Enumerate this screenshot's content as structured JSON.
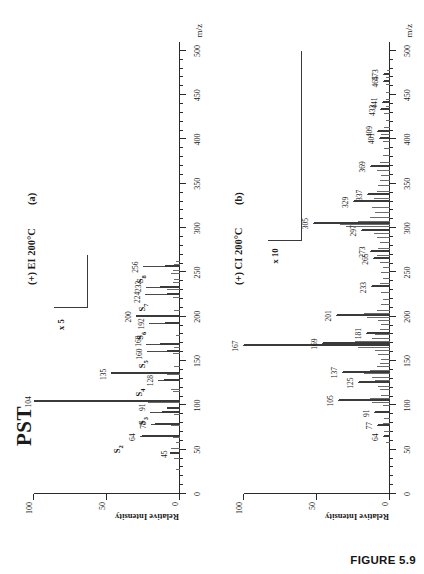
{
  "figure": {
    "caption": "FIGURE 5.9",
    "sample_title": "PST"
  },
  "axis": {
    "x_title": "m/z",
    "y_title": "Relative Intensity",
    "x_ticks": [
      0,
      50,
      100,
      150,
      200,
      250,
      300,
      350,
      400,
      450,
      500
    ],
    "y_ticks": [
      0,
      50,
      100
    ]
  },
  "panels": [
    {
      "tag": "(a)",
      "conditions": "(+) EI  200°C",
      "magnification": "x 5",
      "mag_region_start": 210,
      "mag_region_end": 270
    },
    {
      "tag": "(b)",
      "conditions": "(+) CI  200°C",
      "magnification": "x 10",
      "mag_region_start": 285,
      "mag_region_end": 500
    }
  ],
  "chart_data": [
    {
      "type": "bar",
      "title": "PST (+) EI 200°C mass spectrum",
      "xlabel": "m/z",
      "ylabel": "Relative Intensity",
      "xlim": [
        0,
        510
      ],
      "ylim": [
        0,
        100
      ],
      "grid": false,
      "annotations": [
        "PST",
        "(+) EI  200°C",
        "(a)",
        "x 5"
      ],
      "labeled_peaks": [
        {
          "mz": 45,
          "intensity": 7,
          "label": "45"
        },
        {
          "mz": 64,
          "intensity": 26,
          "label": "64",
          "series_tag": "S2"
        },
        {
          "mz": 78,
          "intensity": 17,
          "label": "78"
        },
        {
          "mz": 91,
          "intensity": 12,
          "label": "91"
        },
        {
          "mz": 96,
          "intensity": 9,
          "label": "",
          "series_tag": "S3"
        },
        {
          "mz": 104,
          "intensity": 100,
          "label": "104"
        },
        {
          "mz": 128,
          "intensity": 11,
          "label": "128",
          "series_tag": "S4"
        },
        {
          "mz": 135,
          "intensity": 47,
          "label": "135"
        },
        {
          "mz": 160,
          "intensity": 9,
          "label": "160",
          "series_tag": "S5"
        },
        {
          "mz": 168,
          "intensity": 14,
          "label": "168"
        },
        {
          "mz": 192,
          "intensity": 10,
          "label": "192",
          "series_tag": "S6"
        },
        {
          "mz": 200,
          "intensity": 30,
          "label": "200"
        },
        {
          "mz": 224,
          "intensity": 9,
          "label": "224",
          "series_tag": "S7"
        },
        {
          "mz": 232,
          "intensity": 14,
          "label": "232"
        },
        {
          "mz": 256,
          "intensity": 10,
          "label": "256",
          "series_tag": "S8"
        }
      ],
      "series_tags": [
        "S2",
        "S3",
        "S4",
        "S5",
        "S6",
        "S7",
        "S8"
      ]
    },
    {
      "type": "bar",
      "title": "PST (+) CI 200°C mass spectrum",
      "xlabel": "m/z",
      "ylabel": "Relative Intensity",
      "xlim": [
        0,
        510
      ],
      "ylim": [
        0,
        100
      ],
      "grid": false,
      "annotations": [
        "(+) CI  200°C",
        "(b)",
        "x 10"
      ],
      "labeled_peaks": [
        {
          "mz": 64,
          "intensity": 4,
          "label": "64"
        },
        {
          "mz": 77,
          "intensity": 8,
          "label": "77"
        },
        {
          "mz": 91,
          "intensity": 10,
          "label": "91"
        },
        {
          "mz": 105,
          "intensity": 35,
          "label": "105"
        },
        {
          "mz": 125,
          "intensity": 21,
          "label": "125"
        },
        {
          "mz": 137,
          "intensity": 32,
          "label": "137"
        },
        {
          "mz": 167,
          "intensity": 100,
          "label": "167"
        },
        {
          "mz": 169,
          "intensity": 46,
          "label": "169"
        },
        {
          "mz": 181,
          "intensity": 16,
          "label": "181"
        },
        {
          "mz": 201,
          "intensity": 36,
          "label": "201"
        },
        {
          "mz": 233,
          "intensity": 12,
          "label": "233"
        },
        {
          "mz": 265,
          "intensity": 11,
          "label": "265"
        },
        {
          "mz": 273,
          "intensity": 13,
          "label": "273"
        },
        {
          "mz": 297,
          "intensity": 19,
          "label": "297"
        },
        {
          "mz": 305,
          "intensity": 52,
          "label": "305"
        },
        {
          "mz": 329,
          "intensity": 25,
          "label": "329"
        },
        {
          "mz": 337,
          "intensity": 15,
          "label": "337"
        },
        {
          "mz": 369,
          "intensity": 13,
          "label": "369"
        },
        {
          "mz": 401,
          "intensity": 7,
          "label": "401"
        },
        {
          "mz": 409,
          "intensity": 8,
          "label": "409"
        },
        {
          "mz": 433,
          "intensity": 6,
          "label": "433"
        },
        {
          "mz": 441,
          "intensity": 5,
          "label": "441"
        },
        {
          "mz": 465,
          "intensity": 4,
          "label": "465"
        },
        {
          "mz": 473,
          "intensity": 4,
          "label": "473"
        }
      ]
    }
  ],
  "noise_a": [
    {
      "mz": 27,
      "intensity": 3
    },
    {
      "mz": 39,
      "intensity": 4
    },
    {
      "mz": 51,
      "intensity": 6
    },
    {
      "mz": 58,
      "intensity": 3
    },
    {
      "mz": 63,
      "intensity": 5
    },
    {
      "mz": 65,
      "intensity": 7
    },
    {
      "mz": 77,
      "intensity": 6
    },
    {
      "mz": 79,
      "intensity": 5
    },
    {
      "mz": 89,
      "intensity": 4
    },
    {
      "mz": 92,
      "intensity": 5
    },
    {
      "mz": 103,
      "intensity": 22
    },
    {
      "mz": 105,
      "intensity": 18
    },
    {
      "mz": 115,
      "intensity": 5
    },
    {
      "mz": 117,
      "intensity": 6
    },
    {
      "mz": 129,
      "intensity": 6
    },
    {
      "mz": 134,
      "intensity": 9
    },
    {
      "mz": 143,
      "intensity": 4
    },
    {
      "mz": 158,
      "intensity": 5
    },
    {
      "mz": 165,
      "intensity": 4
    },
    {
      "mz": 178,
      "intensity": 3
    },
    {
      "mz": 193,
      "intensity": 5
    },
    {
      "mz": 207,
      "intensity": 4
    },
    {
      "mz": 221,
      "intensity": 5
    },
    {
      "mz": 226,
      "intensity": 6
    },
    {
      "mz": 230,
      "intensity": 9
    },
    {
      "mz": 234,
      "intensity": 7
    },
    {
      "mz": 238,
      "intensity": 5
    },
    {
      "mz": 242,
      "intensity": 4
    },
    {
      "mz": 248,
      "intensity": 6
    },
    {
      "mz": 252,
      "intensity": 5
    },
    {
      "mz": 258,
      "intensity": 4
    },
    {
      "mz": 262,
      "intensity": 3
    }
  ],
  "noise_b": [
    {
      "mz": 57,
      "intensity": 3
    },
    {
      "mz": 70,
      "intensity": 4
    },
    {
      "mz": 79,
      "intensity": 5
    },
    {
      "mz": 85,
      "intensity": 4
    },
    {
      "mz": 93,
      "intensity": 6
    },
    {
      "mz": 99,
      "intensity": 5
    },
    {
      "mz": 103,
      "intensity": 12
    },
    {
      "mz": 107,
      "intensity": 14
    },
    {
      "mz": 111,
      "intensity": 6
    },
    {
      "mz": 117,
      "intensity": 7
    },
    {
      "mz": 121,
      "intensity": 8
    },
    {
      "mz": 127,
      "intensity": 10
    },
    {
      "mz": 131,
      "intensity": 12
    },
    {
      "mz": 135,
      "intensity": 18
    },
    {
      "mz": 139,
      "intensity": 14
    },
    {
      "mz": 143,
      "intensity": 9
    },
    {
      "mz": 147,
      "intensity": 7
    },
    {
      "mz": 151,
      "intensity": 6
    },
    {
      "mz": 157,
      "intensity": 8
    },
    {
      "mz": 161,
      "intensity": 10
    },
    {
      "mz": 165,
      "intensity": 22
    },
    {
      "mz": 171,
      "intensity": 24
    },
    {
      "mz": 175,
      "intensity": 12
    },
    {
      "mz": 179,
      "intensity": 10
    },
    {
      "mz": 185,
      "intensity": 7
    },
    {
      "mz": 191,
      "intensity": 6
    },
    {
      "mz": 195,
      "intensity": 8
    },
    {
      "mz": 199,
      "intensity": 16
    },
    {
      "mz": 203,
      "intensity": 18
    },
    {
      "mz": 207,
      "intensity": 9
    },
    {
      "mz": 213,
      "intensity": 6
    },
    {
      "mz": 219,
      "intensity": 5
    },
    {
      "mz": 227,
      "intensity": 6
    },
    {
      "mz": 237,
      "intensity": 7
    },
    {
      "mz": 243,
      "intensity": 5
    },
    {
      "mz": 249,
      "intensity": 6
    },
    {
      "mz": 255,
      "intensity": 5
    },
    {
      "mz": 261,
      "intensity": 7
    },
    {
      "mz": 269,
      "intensity": 9
    },
    {
      "mz": 277,
      "intensity": 8
    },
    {
      "mz": 283,
      "intensity": 7
    },
    {
      "mz": 289,
      "intensity": 9
    },
    {
      "mz": 293,
      "intensity": 11
    },
    {
      "mz": 301,
      "intensity": 30
    },
    {
      "mz": 303,
      "intensity": 34
    },
    {
      "mz": 307,
      "intensity": 22
    },
    {
      "mz": 311,
      "intensity": 14
    },
    {
      "mz": 317,
      "intensity": 10
    },
    {
      "mz": 323,
      "intensity": 12
    },
    {
      "mz": 333,
      "intensity": 11
    },
    {
      "mz": 341,
      "intensity": 9
    },
    {
      "mz": 347,
      "intensity": 8
    },
    {
      "mz": 353,
      "intensity": 7
    },
    {
      "mz": 359,
      "intensity": 6
    },
    {
      "mz": 365,
      "intensity": 9
    },
    {
      "mz": 373,
      "intensity": 7
    },
    {
      "mz": 381,
      "intensity": 5
    },
    {
      "mz": 389,
      "intensity": 4
    },
    {
      "mz": 397,
      "intensity": 5
    },
    {
      "mz": 405,
      "intensity": 6
    },
    {
      "mz": 413,
      "intensity": 4
    },
    {
      "mz": 421,
      "intensity": 3
    },
    {
      "mz": 429,
      "intensity": 4
    },
    {
      "mz": 437,
      "intensity": 3
    },
    {
      "mz": 445,
      "intensity": 3
    },
    {
      "mz": 453,
      "intensity": 3
    },
    {
      "mz": 461,
      "intensity": 3
    },
    {
      "mz": 469,
      "intensity": 3
    },
    {
      "mz": 477,
      "intensity": 2
    }
  ]
}
